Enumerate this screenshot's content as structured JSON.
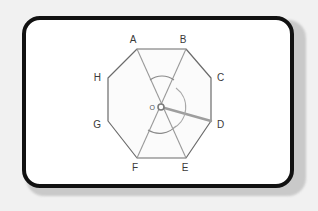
{
  "figure": {
    "kind": "geometry-diagram",
    "shape": "regular-octagon",
    "frame": {
      "style": "rounded-rectangle",
      "border_color": "#111111",
      "fill_color": "#ffffff",
      "page_background": "#f1f1f1",
      "shadow_color": "#c9c9c9"
    },
    "polygon": {
      "name": "ABCDEFGH",
      "stroke_color": "#6b6b6b",
      "fill_color": "#fbfbfb",
      "vertices": [
        {
          "label": "A",
          "x": 137,
          "y": 49,
          "label_x": 133,
          "label_y": 43
        },
        {
          "label": "B",
          "x": 186,
          "y": 49,
          "label_x": 183,
          "label_y": 43
        },
        {
          "label": "C",
          "x": 211,
          "y": 78,
          "label_x": 215,
          "label_y": 81
        },
        {
          "label": "D",
          "x": 211,
          "y": 121,
          "label_x": 215,
          "label_y": 128
        },
        {
          "label": "E",
          "x": 186,
          "y": 158,
          "label_x": 182,
          "label_y": 170
        },
        {
          "label": "F",
          "x": 137,
          "y": 158,
          "label_x": 132,
          "label_y": 170
        },
        {
          "label": "G",
          "x": 108,
          "y": 121,
          "label_x": 98,
          "label_y": 128
        },
        {
          "label": "H",
          "x": 108,
          "y": 78,
          "label_x": 98,
          "label_y": 81
        }
      ]
    },
    "center": {
      "label": "O",
      "x": 161,
      "y": 107,
      "label_x": 154,
      "label_y": 111,
      "marker_radius": 3,
      "marker_color": "#7a7a7a"
    },
    "diagonals": [
      {
        "name": "A-E",
        "from": "A",
        "to": "E",
        "stroke_color": "#9a9a9a"
      },
      {
        "name": "B-F",
        "from": "B",
        "to": "F",
        "stroke_color": "#9a9a9a"
      }
    ],
    "rays": [
      {
        "name": "O-D",
        "from": "O",
        "to": "D",
        "stroke_color": "#9e9e9e",
        "stroke_width": 2.4
      }
    ],
    "arcs": [
      {
        "name": "upper-angle-arc",
        "color": "#8a8a8a"
      },
      {
        "name": "lower-angle-arc",
        "color": "#8a8a8a"
      },
      {
        "name": "right-angle-arc",
        "color": "#a8a8a8"
      }
    ],
    "labels": {
      "vertex_text_color": "#3a3a3a",
      "center_text_color": "#555555"
    }
  }
}
